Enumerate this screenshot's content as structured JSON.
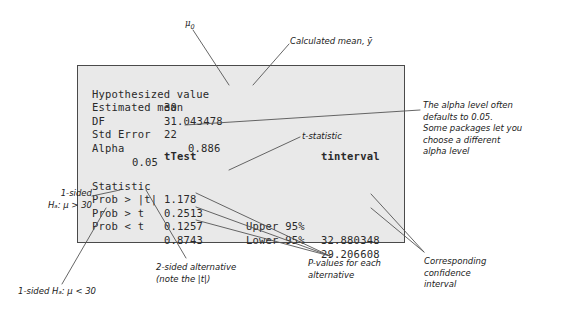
{
  "panel": {
    "summary_rows": [
      {
        "label": "Hypothesized value",
        "value": "30",
        "value_x": 86
      },
      {
        "label": "Estimated mean",
        "value": "31.043478",
        "value_x": 86
      },
      {
        "label": "DF",
        "value": "22",
        "value_x": 86
      },
      {
        "label": "Std Error",
        "value": "0.886",
        "value_x": 110
      },
      {
        "label": "Alpha",
        "value": "0.05",
        "value_x": 54
      }
    ],
    "test_header": "tTest",
    "interval_header": "tinterval",
    "test_rows": [
      {
        "label": "Statistic",
        "value": "1.178"
      },
      {
        "label": "Prob > |t|",
        "value": "0.2513"
      },
      {
        "label": "Prob > t",
        "value": "0.1257"
      },
      {
        "label": "Prob < t",
        "value": "0.8743"
      }
    ],
    "interval_rows": [
      {
        "label": "Upper 95%",
        "value": "32.880348"
      },
      {
        "label": "Lower 95%",
        "value": "29.206608"
      }
    ]
  },
  "annotations": {
    "mu_zero": "μ",
    "mu_zero_sub": "0",
    "calculated_mean": "Calculated mean, ȳ",
    "alpha_note": "The alpha level often\ndefaults to 0.05.\nSome packages let you\nchoose a different\nalpha level",
    "t_statistic": "t-statistic",
    "one_sided_greater": "1-sided\nHₐ: μ > 30",
    "one_sided_less": "1-sided Hₐ: μ < 30",
    "two_sided": "2-sided alternative\n(note the |t|)",
    "p_values": "P-values for each\nalternative",
    "confidence_interval": "Corresponding\nconfidence\ninterval"
  },
  "colors": {
    "panel_background": "#e9e9e9",
    "panel_border": "#4a4a4a",
    "text": "#2a2a2a",
    "annotation": "#1a1a1a",
    "leader_line": "#555555",
    "page_background": "#ffffff"
  }
}
